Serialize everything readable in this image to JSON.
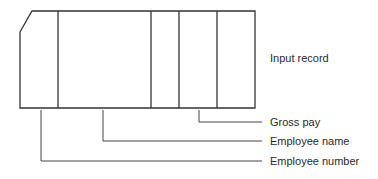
{
  "diagram": {
    "title_label": "Input record",
    "fields": [
      {
        "label": "Gross pay"
      },
      {
        "label": "Employee name"
      },
      {
        "label": "Employee number"
      }
    ],
    "stroke_color": "#333333",
    "text_color": "#2a2a2a"
  }
}
